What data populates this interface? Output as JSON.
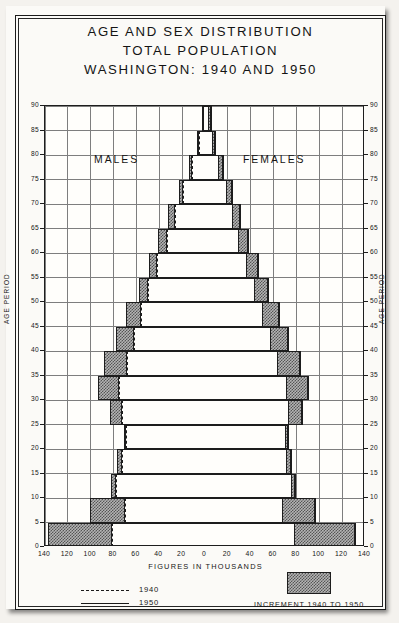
{
  "title": {
    "line1": "AGE AND SEX DISTRIBUTION",
    "line2": "TOTAL POPULATION",
    "line3": "WASHINGTON: 1940 AND 1950"
  },
  "labels": {
    "males": "MALES",
    "females": "FEMALES",
    "age_period_left": "AGE PERIOD",
    "age_period_right": "AGE PERIOD",
    "figures": "FIGURES IN THOUSANDS"
  },
  "legend": {
    "line_1940": "1940",
    "line_1950": "1950",
    "increment": "INCREMENT 1940 TO 1950",
    "dash_icon": "dashed-line-icon",
    "solid_icon": "solid-line-icon",
    "swatch_icon": "hatched-swatch-icon"
  },
  "axis": {
    "y_ticks": [
      0,
      5,
      10,
      15,
      20,
      25,
      30,
      35,
      40,
      45,
      50,
      55,
      60,
      65,
      70,
      75,
      80,
      85,
      90
    ],
    "x_ticks": [
      140,
      120,
      100,
      80,
      60,
      40,
      20,
      0,
      20,
      40,
      60,
      80,
      100,
      120,
      140
    ],
    "x_min": -140,
    "x_max": 140,
    "y_min": 0,
    "y_max": 90
  },
  "colors": {
    "ink": "#1d1d1d",
    "grid": "#7e7e7e",
    "paper": "#fbfaf7",
    "increment_fill": "#b4b4b4"
  },
  "chart_data": {
    "type": "bar",
    "subtype": "population-pyramid",
    "title": "AGE AND SEX DISTRIBUTION TOTAL POPULATION WASHINGTON: 1940 AND 1950",
    "xlabel": "FIGURES IN THOUSANDS",
    "ylabel": "AGE PERIOD",
    "xlim": [
      -140,
      140
    ],
    "ylim": [
      0,
      90
    ],
    "grid": true,
    "legend_position": "below-plot",
    "units": "thousands of persons",
    "categories": [
      "0-5",
      "5-10",
      "10-15",
      "15-20",
      "20-25",
      "25-30",
      "30-35",
      "35-40",
      "40-45",
      "45-50",
      "50-55",
      "55-60",
      "60-65",
      "65-70",
      "70-75",
      "75-80",
      "80-85",
      "85-90"
    ],
    "series": [
      {
        "name": "Males 1940",
        "side": "left",
        "values": [
          81,
          70,
          78,
          73,
          69,
          73,
          75,
          68,
          62,
          56,
          50,
          42,
          33,
          26,
          19,
          11,
          5,
          2
        ]
      },
      {
        "name": "Males 1950",
        "side": "left",
        "values": [
          137,
          101,
          82,
          77,
          71,
          83,
          94,
          88,
          78,
          69,
          58,
          49,
          41,
          32,
          23,
          14,
          7,
          3
        ]
      },
      {
        "name": "Females 1940",
        "side": "right",
        "values": [
          78,
          67,
          75,
          71,
          70,
          73,
          71,
          63,
          57,
          50,
          43,
          36,
          29,
          24,
          18,
          11,
          6,
          3
        ]
      },
      {
        "name": "Females 1950",
        "side": "right",
        "values": [
          131,
          96,
          79,
          75,
          73,
          85,
          90,
          83,
          73,
          65,
          55,
          46,
          38,
          31,
          24,
          16,
          9,
          5
        ]
      }
    ]
  }
}
